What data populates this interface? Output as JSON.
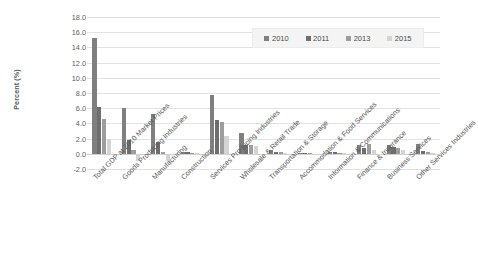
{
  "chart_data": {
    "type": "bar",
    "title": "",
    "xlabel": "",
    "ylabel": "Percent (%)",
    "ylim": [
      -2.0,
      18.0
    ],
    "ytick_labels": [
      "18.0",
      "16.0",
      "14.0",
      "12.0",
      "10.0",
      "8.0",
      "6.0",
      "4.0",
      "2.0",
      "0.0",
      "-2.0"
    ],
    "yticks": [
      18.0,
      16.0,
      14.0,
      12.0,
      10.0,
      8.0,
      6.0,
      4.0,
      2.0,
      0.0,
      -2.0
    ],
    "grid": true,
    "legend_position": "top-right",
    "categories": [
      "Total GDP at 2010 Market Prices",
      "Goods Producing Industries",
      "Manufacturing",
      "Construction",
      "Services Producing Industries",
      "Wholesale & Retail Trade",
      "Transportation & Storage",
      "Accommodation & Food Services",
      "Information & Communications",
      "Finance & Insurance",
      "Business Services",
      "Other Services Industries"
    ],
    "series": [
      {
        "name": "2010",
        "color": "#7f7f7f",
        "values": [
          15.2,
          6.0,
          5.3,
          0.2,
          7.8,
          2.8,
          0.5,
          0.1,
          0.25,
          1.2,
          1.15,
          1.35
        ]
      },
      {
        "name": "2011",
        "color": "#6e6e6e",
        "values": [
          6.2,
          1.85,
          1.5,
          0.2,
          4.4,
          1.15,
          0.3,
          0.15,
          0.2,
          0.8,
          0.95,
          0.35
        ]
      },
      {
        "name": "2013",
        "color": "#9d9d9d",
        "values": [
          4.6,
          0.5,
          0.25,
          0.15,
          4.2,
          1.1,
          0.2,
          0.05,
          0.15,
          1.35,
          0.8,
          0.2
        ]
      },
      {
        "name": "2015",
        "color": "#d4d4d4",
        "values": [
          2.0,
          -1.0,
          -0.95,
          0.15,
          2.3,
          1.05,
          0.1,
          0.03,
          0.1,
          0.55,
          0.45,
          0.1
        ]
      }
    ]
  },
  "legend": {
    "items": [
      {
        "label": "2010",
        "color": "#7f7f7f"
      },
      {
        "label": "2011",
        "color": "#6e6e6e"
      },
      {
        "label": "2013",
        "color": "#9d9d9d"
      },
      {
        "label": "2015",
        "color": "#d4d4d4"
      }
    ]
  },
  "axes": {
    "y_title": "Percent (%)"
  }
}
